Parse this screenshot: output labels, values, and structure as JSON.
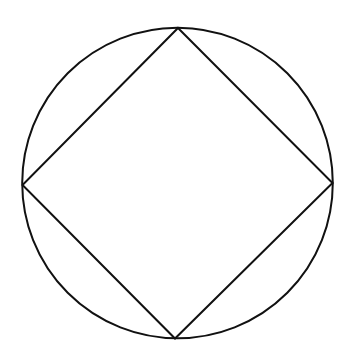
{
  "diagram": {
    "stroke_color": "#111111",
    "background_color": "#ffffff",
    "shapes": [
      {
        "type": "circle",
        "name": "circumscribed-circle"
      },
      {
        "type": "polygon",
        "name": "inscribed-square",
        "vertices": [
          "top",
          "right",
          "bottom",
          "left"
        ]
      }
    ]
  }
}
